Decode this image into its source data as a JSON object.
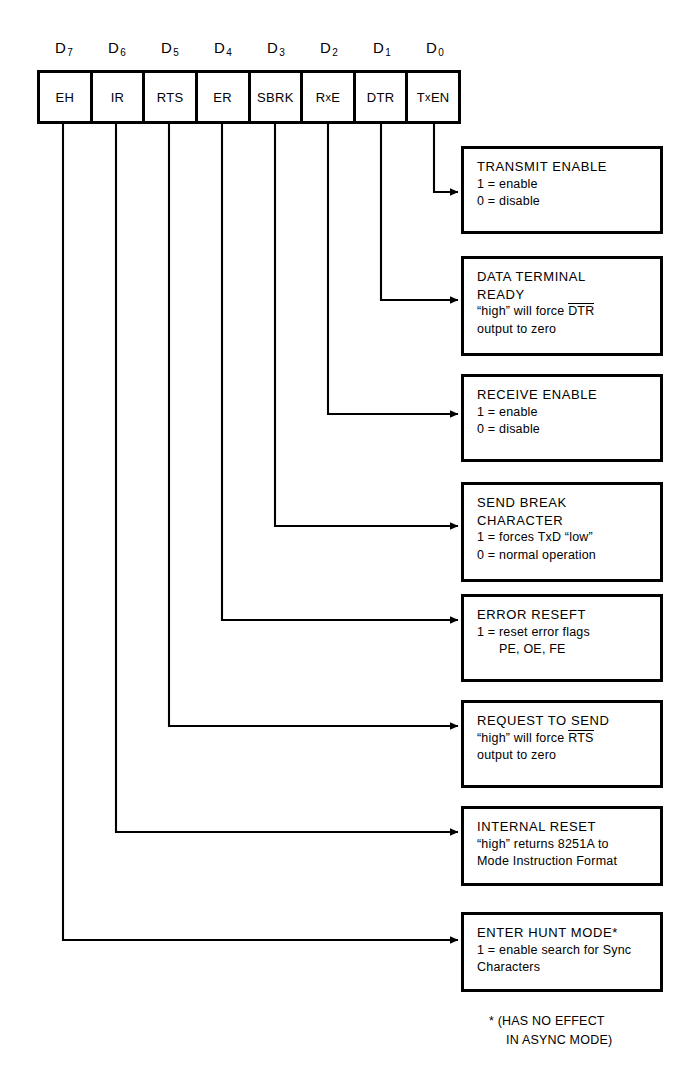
{
  "bit_labels": [
    {
      "name": "D7",
      "base": "D",
      "sub": "7"
    },
    {
      "name": "D6",
      "base": "D",
      "sub": "6"
    },
    {
      "name": "D5",
      "base": "D",
      "sub": "5"
    },
    {
      "name": "D4",
      "base": "D",
      "sub": "4"
    },
    {
      "name": "D3",
      "base": "D",
      "sub": "3"
    },
    {
      "name": "D2",
      "base": "D",
      "sub": "2"
    },
    {
      "name": "D1",
      "base": "D",
      "sub": "1"
    },
    {
      "name": "D0",
      "base": "D",
      "sub": "0"
    }
  ],
  "bit_cells": [
    {
      "label": "EH"
    },
    {
      "label": "IR"
    },
    {
      "label": "RTS"
    },
    {
      "label": "ER"
    },
    {
      "label": "SBRK"
    },
    {
      "label": "RxE",
      "pre": "R",
      "lc": "x",
      "post": "E"
    },
    {
      "label": "DTR"
    },
    {
      "label": "TxEN",
      "pre": "T",
      "lc": "x",
      "post": "EN"
    }
  ],
  "callouts": [
    {
      "bit": "D0",
      "title": "TRANSMIT ENABLE",
      "lines": [
        "1 = enable",
        "0 = disable"
      ]
    },
    {
      "bit": "D1",
      "title": "DATA TERMINAL",
      "title2": "READY",
      "lines": [
        "“high” will force DTR",
        "output to zero"
      ],
      "overline_line": 0,
      "overline_prefix": "“high” will force ",
      "overline_text": "DTR"
    },
    {
      "bit": "D2",
      "title": "RECEIVE ENABLE",
      "lines": [
        "1 = enable",
        "0 = disable"
      ]
    },
    {
      "bit": "D3",
      "title": "SEND BREAK",
      "title2": "CHARACTER",
      "lines": [
        "1 = forces TxD “low”",
        "0 = normal operation"
      ]
    },
    {
      "bit": "D4",
      "title": "ERROR RESEFT",
      "lines": [
        "1 = reset error flags"
      ],
      "indent_line": "PE, OE, FE"
    },
    {
      "bit": "D5",
      "title": "REQUEST TO SEND",
      "lines": [
        "“high” will force RTS",
        "output to zero"
      ],
      "overline_line": 0,
      "overline_prefix": "“high” will force ",
      "overline_text": "RTS"
    },
    {
      "bit": "D6",
      "title": "INTERNAL RESET",
      "lines": [
        "“high” returns 8251A to",
        "Mode Instruction Format"
      ]
    },
    {
      "bit": "D7",
      "title": "ENTER HUNT MODE*",
      "lines": [
        "1 = enable search for Sync",
        "Characters"
      ]
    }
  ],
  "footnote": {
    "line1": "* (HAS NO EFFECT",
    "line2": "IN ASYNC MODE)"
  },
  "colors": {
    "ink": "#000000",
    "background": "#ffffff"
  }
}
